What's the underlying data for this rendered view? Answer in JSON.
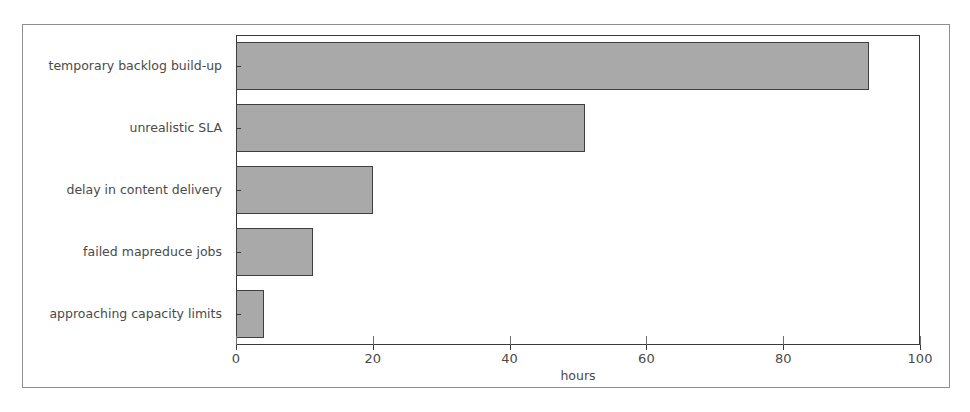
{
  "chart_data": {
    "type": "bar",
    "orientation": "horizontal",
    "title": "",
    "xlabel": "hours",
    "ylabel": "",
    "categories": [
      "temporary backlog build-up",
      "unrealistic SLA",
      "delay in content delivery",
      "failed mapreduce jobs",
      "approaching capacity limits"
    ],
    "values": [
      92.5,
      51,
      20,
      11.3,
      4.1
    ],
    "xlim": [
      0,
      100
    ],
    "xticks": [
      0,
      20,
      40,
      60,
      80,
      100
    ],
    "xticklabels": [
      "0",
      "20",
      "40",
      "60",
      "80",
      "100"
    ],
    "grid": false,
    "legend": null,
    "bar_color": "#a9a9a9",
    "bar_edge_color": "#3f3f3f",
    "axis_color": "#3a3a3a",
    "text_color": "#4a4a4a",
    "background": "#ffffff"
  }
}
